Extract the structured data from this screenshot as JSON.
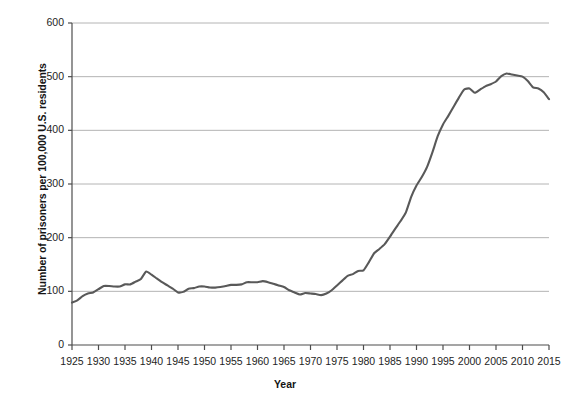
{
  "chart_data": {
    "type": "line",
    "title": "",
    "subtitle": "",
    "xlabel": "Year",
    "ylabel": "Number of prisoners per 100,000 U.S. residents",
    "xlim": [
      1925,
      2015
    ],
    "ylim": [
      0,
      600
    ],
    "ytick_labels": [
      "0",
      "100",
      "200",
      "300",
      "400",
      "500",
      "600"
    ],
    "ytick_values": [
      0,
      100,
      200,
      300,
      400,
      500,
      600
    ],
    "xtick_labels": [
      "1925",
      "1930",
      "1935",
      "1940",
      "1945",
      "1950",
      "1955",
      "1960",
      "1965",
      "1970",
      "1975",
      "1980",
      "1985",
      "1990",
      "1995",
      "2000",
      "2005",
      "2010",
      "2015"
    ],
    "xtick_values": [
      1925,
      1930,
      1935,
      1940,
      1945,
      1950,
      1955,
      1960,
      1965,
      1970,
      1975,
      1980,
      1985,
      1990,
      1995,
      2000,
      2005,
      2010,
      2015
    ],
    "grid": "horizontal",
    "legend": "none",
    "line_color": "#595959",
    "grid_color": "#b4b4b4",
    "axis_color": "#4d4d4d",
    "series": [
      {
        "name": "Imprisonment rate",
        "x": [
          1925,
          1926,
          1927,
          1928,
          1929,
          1930,
          1931,
          1932,
          1933,
          1934,
          1935,
          1936,
          1937,
          1938,
          1939,
          1940,
          1941,
          1942,
          1943,
          1944,
          1945,
          1946,
          1947,
          1948,
          1949,
          1950,
          1951,
          1952,
          1953,
          1954,
          1955,
          1956,
          1957,
          1958,
          1959,
          1960,
          1961,
          1962,
          1963,
          1964,
          1965,
          1966,
          1967,
          1968,
          1969,
          1970,
          1971,
          1972,
          1973,
          1974,
          1975,
          1976,
          1977,
          1978,
          1979,
          1980,
          1981,
          1982,
          1983,
          1984,
          1985,
          1986,
          1987,
          1988,
          1989,
          1990,
          1991,
          1992,
          1993,
          1994,
          1995,
          1996,
          1997,
          1998,
          1999,
          2000,
          2001,
          2002,
          2003,
          2004,
          2005,
          2006,
          2007,
          2008,
          2009,
          2010,
          2011,
          2012,
          2013,
          2014,
          2015
        ],
        "values": [
          79,
          83,
          91,
          96,
          98,
          104,
          110,
          110,
          109,
          109,
          113,
          113,
          118,
          123,
          137,
          131,
          124,
          117,
          111,
          105,
          98,
          99,
          105,
          106,
          109,
          109,
          107,
          107,
          108,
          110,
          112,
          112,
          113,
          117,
          117,
          117,
          119,
          117,
          114,
          111,
          108,
          102,
          98,
          94,
          97,
          96,
          95,
          93,
          96,
          102,
          111,
          120,
          129,
          132,
          138,
          139,
          154,
          171,
          179,
          188,
          202,
          217,
          231,
          247,
          276,
          297,
          313,
          332,
          359,
          389,
          411,
          427,
          444,
          461,
          476,
          478,
          470,
          476,
          482,
          486,
          491,
          501,
          506,
          504,
          502,
          500,
          492,
          480,
          478,
          471,
          458
        ]
      }
    ]
  },
  "axes": {
    "y_title": "Number of prisoners per 100,000 U.S. residents",
    "x_title": "Year"
  }
}
